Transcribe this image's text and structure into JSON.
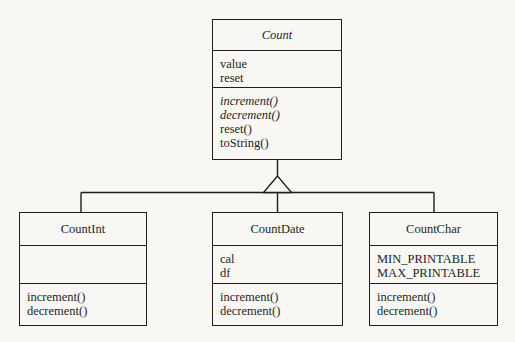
{
  "colors": {
    "line": "#1f1f1f",
    "text": "#1f1f1f",
    "bg": "#f8f7f3"
  },
  "diagram": {
    "type": "uml-class-diagram",
    "relationship": "generalization",
    "parent": {
      "name": "Count",
      "abstract": true,
      "attributes": [
        "value",
        "reset"
      ],
      "methods": [
        "increment()",
        "decrement()",
        "reset()",
        "toString()"
      ]
    },
    "children": [
      {
        "name": "CountInt",
        "attributes": [],
        "methods": [
          "increment()",
          "decrement()"
        ]
      },
      {
        "name": "CountDate",
        "attributes": [
          "cal",
          "df"
        ],
        "methods": [
          "increment()",
          "decrement()"
        ]
      },
      {
        "name": "CountChar",
        "attributes": [
          "MIN_PRINTABLE",
          "MAX_PRINTABLE"
        ],
        "methods": [
          "increment()",
          "decrement()"
        ]
      }
    ]
  }
}
